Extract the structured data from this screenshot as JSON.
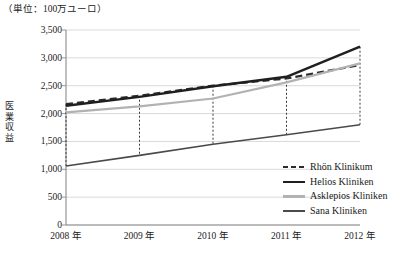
{
  "unit_note": "（単位：100万ユーロ）",
  "axis": {
    "y_title_chars": [
      "医",
      "業",
      "収",
      "益"
    ],
    "y_title": "医業収益",
    "y_ticks": [
      "3,500",
      "3,000",
      "2,500",
      "2,000",
      "1,500",
      "1,000",
      "500",
      "0"
    ],
    "x_ticks": [
      "2008 年",
      "2009 年",
      "2010 年",
      "2011 年",
      "2012 年"
    ]
  },
  "colors": {
    "rhoen": "#2b2b2b",
    "helios": "#1f1f1f",
    "asklepios": "#b2b2b2",
    "sana": "#4a4a4a",
    "grid": "#cfcfcf",
    "axis": "#8a8a8a",
    "dropline": "#3a3a3a"
  },
  "legend": {
    "items": [
      {
        "label": "Rhön Klinikum",
        "style": "dashed",
        "color": "#2b2b2b",
        "width": 2.2
      },
      {
        "label": "Helios Kliniken",
        "style": "solid",
        "color": "#1f1f1f",
        "width": 2.4
      },
      {
        "label": "Asklepios Kliniken",
        "style": "solid",
        "color": "#b2b2b2",
        "width": 2.2
      },
      {
        "label": "Sana Kliniken",
        "style": "solid",
        "color": "#4a4a4a",
        "width": 1.6
      }
    ]
  },
  "chart_data": {
    "type": "line",
    "title": "",
    "subtitle": "",
    "xlabel": "",
    "ylabel": "医業収益",
    "unit": "100万ユーロ",
    "categories": [
      "2008 年",
      "2009 年",
      "2010 年",
      "2011 年",
      "2012 年"
    ],
    "x_numeric": [
      2008,
      2009,
      2010,
      2011,
      2012
    ],
    "ylim": [
      0,
      3500
    ],
    "ytick_step": 500,
    "grid": true,
    "legend_position": "right-bottom",
    "series": [
      {
        "name": "Rhön Klinikum",
        "values": [
          2170,
          2320,
          2500,
          2630,
          2870
        ]
      },
      {
        "name": "Helios Kliniken",
        "values": [
          2140,
          2300,
          2490,
          2660,
          3200
        ]
      },
      {
        "name": "Asklepios Kliniken",
        "values": [
          2020,
          2130,
          2270,
          2560,
          2900
        ]
      },
      {
        "name": "Sana Kliniken",
        "values": [
          1060,
          1250,
          1450,
          1620,
          1800
        ]
      }
    ]
  }
}
